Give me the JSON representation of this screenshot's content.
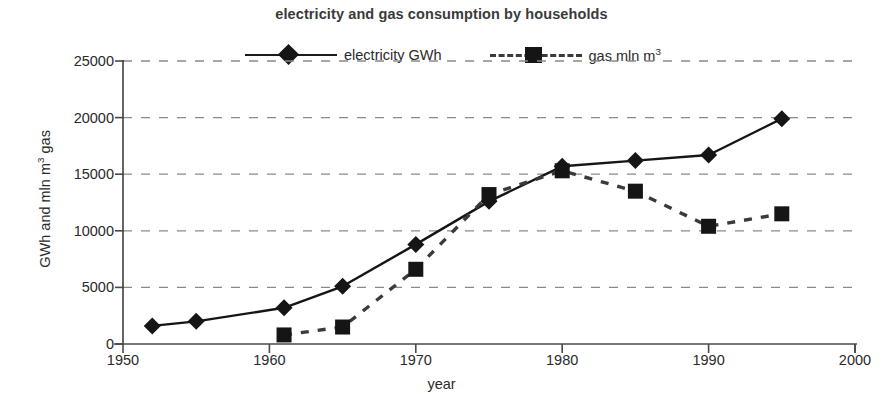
{
  "chart_data": {
    "type": "line",
    "title": "electricity and gas consumption by households",
    "xlabel": "year",
    "ylabel": "GWh and mln m³ gas",
    "xlim": [
      1950,
      2000
    ],
    "ylim": [
      0,
      25000
    ],
    "xticks": [
      "1950",
      "1960",
      "1970",
      "1980",
      "1990",
      "2000"
    ],
    "xtick_values": [
      1950,
      1960,
      1970,
      1980,
      1990,
      2000
    ],
    "yticks": [
      "0",
      "5000",
      "10000",
      "15000",
      "20000",
      "25000"
    ],
    "ytick_values": [
      0,
      5000,
      10000,
      15000,
      20000,
      25000
    ],
    "grid": "horizontal-dashed",
    "legend_position": "top-center",
    "series": [
      {
        "name": "electricity GWh",
        "legend_label_html": "electricity GWh",
        "marker": "diamond",
        "line_style": "solid",
        "color": "#151515",
        "x": [
          1952,
          1955,
          1961,
          1965,
          1970,
          1975,
          1980,
          1985,
          1990,
          1995
        ],
        "values": [
          1600,
          2000,
          3200,
          5100,
          8800,
          12600,
          15700,
          16200,
          16700,
          19900
        ]
      },
      {
        "name": "gas mln m3",
        "legend_label_prefix": "gas mln m",
        "legend_label_sup": "3",
        "marker": "square",
        "line_style": "dashed",
        "color": "#3a3a3a",
        "x": [
          1961,
          1965,
          1970,
          1975,
          1980,
          1985,
          1990,
          1995
        ],
        "values": [
          800,
          1500,
          6600,
          13200,
          15300,
          13500,
          10400,
          11500
        ]
      }
    ]
  },
  "axis_title_parts": {
    "y_prefix": "GWh and mln m",
    "y_sup": "3",
    "y_suffix": " gas"
  }
}
